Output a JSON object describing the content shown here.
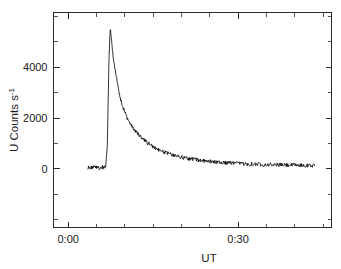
{
  "chart_data": {
    "type": "line",
    "title": "",
    "subtitle": "",
    "xlabel": "UT",
    "ylabel": "U Counts s",
    "ylabel_superscript": "-1",
    "ylabel_full": "U Counts s^-1",
    "x_tick_labels": [
      "0:00",
      "0:30"
    ],
    "x_tick_values": [
      0,
      30
    ],
    "y_tick_labels": [
      "0",
      "2000",
      "4000"
    ],
    "y_tick_values": [
      0,
      2000,
      4000
    ],
    "xlim": [
      -2.6,
      46.5
    ],
    "ylim": [
      -2300,
      6150
    ],
    "x_minor_tick_interval": 5,
    "y_minor_tick_interval": 1000,
    "grid": false,
    "legend": null,
    "legend_position": "none",
    "series": [
      {
        "name": "U band count rate",
        "units": "counts s^-1",
        "x_units": "minutes UT",
        "points": [
          [
            3.5,
            60
          ],
          [
            3.9,
            40
          ],
          [
            4.3,
            75
          ],
          [
            4.7,
            55
          ],
          [
            5.1,
            70
          ],
          [
            5.5,
            45
          ],
          [
            5.9,
            80
          ],
          [
            6.3,
            50
          ],
          [
            6.6,
            65
          ],
          [
            6.9,
            900
          ],
          [
            7.05,
            2600
          ],
          [
            7.2,
            4300
          ],
          [
            7.35,
            5200
          ],
          [
            7.45,
            5500
          ],
          [
            7.6,
            5150
          ],
          [
            7.8,
            4700
          ],
          [
            8.0,
            4250
          ],
          [
            8.2,
            4020
          ],
          [
            8.45,
            3700
          ],
          [
            8.7,
            3380
          ],
          [
            8.95,
            3050
          ],
          [
            9.2,
            2780
          ],
          [
            9.5,
            2520
          ],
          [
            9.8,
            2330
          ],
          [
            10.1,
            2180
          ],
          [
            10.4,
            2000
          ],
          [
            10.8,
            1840
          ],
          [
            11.2,
            1700
          ],
          [
            11.6,
            1560
          ],
          [
            12.0,
            1470
          ],
          [
            12.4,
            1360
          ],
          [
            12.8,
            1290
          ],
          [
            13.2,
            1180
          ],
          [
            13.6,
            1120
          ],
          [
            14.0,
            1020
          ],
          [
            14.4,
            980
          ],
          [
            14.8,
            900
          ],
          [
            15.2,
            860
          ],
          [
            15.6,
            800
          ],
          [
            16.0,
            760
          ],
          [
            16.4,
            700
          ],
          [
            16.8,
            680
          ],
          [
            17.2,
            640
          ],
          [
            17.6,
            610
          ],
          [
            18.0,
            580
          ],
          [
            18.4,
            560
          ],
          [
            18.8,
            520
          ],
          [
            19.2,
            510
          ],
          [
            19.6,
            480
          ],
          [
            20.0,
            470
          ],
          [
            20.4,
            440
          ],
          [
            20.8,
            430
          ],
          [
            21.2,
            410
          ],
          [
            21.6,
            400
          ],
          [
            22.0,
            380
          ],
          [
            22.4,
            375
          ],
          [
            22.8,
            355
          ],
          [
            23.2,
            350
          ],
          [
            23.6,
            330
          ],
          [
            24.0,
            330
          ],
          [
            24.4,
            310
          ],
          [
            24.8,
            305
          ],
          [
            25.2,
            295
          ],
          [
            25.6,
            290
          ],
          [
            26.0,
            280
          ],
          [
            26.4,
            275
          ],
          [
            26.8,
            265
          ],
          [
            27.2,
            260
          ],
          [
            27.6,
            250
          ],
          [
            28.0,
            250
          ],
          [
            28.4,
            240
          ],
          [
            28.8,
            238
          ],
          [
            29.2,
            230
          ],
          [
            29.6,
            228
          ],
          [
            30.0,
            220
          ],
          [
            30.5,
            215
          ],
          [
            31.0,
            210
          ],
          [
            31.5,
            205
          ],
          [
            32.0,
            200
          ],
          [
            32.5,
            196
          ],
          [
            33.0,
            192
          ],
          [
            33.5,
            188
          ],
          [
            34.0,
            185
          ],
          [
            34.5,
            180
          ],
          [
            35.0,
            178
          ],
          [
            35.5,
            174
          ],
          [
            36.0,
            170
          ],
          [
            36.5,
            168
          ],
          [
            37.0,
            164
          ],
          [
            37.5,
            160
          ],
          [
            38.0,
            158
          ],
          [
            38.5,
            155
          ],
          [
            39.0,
            152
          ],
          [
            39.5,
            150
          ],
          [
            40.0,
            148
          ],
          [
            40.5,
            145
          ],
          [
            41.0,
            143
          ],
          [
            41.5,
            140
          ],
          [
            42.0,
            138
          ],
          [
            42.5,
            136
          ],
          [
            43.0,
            134
          ],
          [
            43.5,
            132
          ]
        ],
        "noise_amplitude": 80,
        "peak_value": 5500,
        "peak_time": 7.45,
        "baseline_value": 60,
        "tail_value": 130
      }
    ]
  }
}
